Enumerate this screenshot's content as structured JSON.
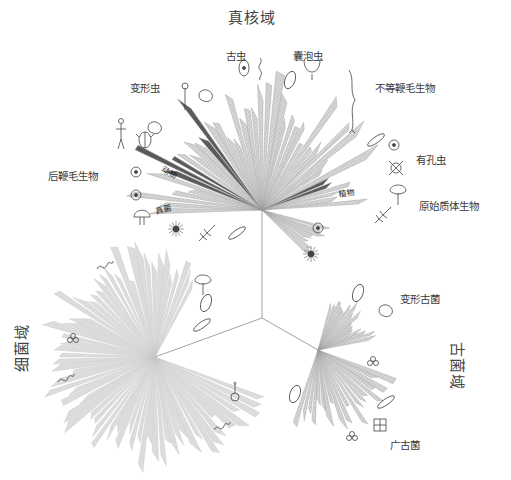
{
  "domains": {
    "eukarya": {
      "label": "真核域",
      "x": 228,
      "y": 6
    },
    "bacteria": {
      "label": "细菌域",
      "x": -2,
      "y": 336
    },
    "archaea": {
      "label": "古菌域",
      "x": 436,
      "y": 355
    }
  },
  "groups": [
    {
      "id": "archaeplastida-old",
      "label": "古虫",
      "x": 226,
      "y": 48
    },
    {
      "id": "alveolata",
      "label": "囊泡虫",
      "x": 293,
      "y": 48
    },
    {
      "id": "amoebozoa",
      "label": "变形虫",
      "x": 130,
      "y": 80
    },
    {
      "id": "stramenopiles",
      "label": "不等鞭毛生物",
      "x": 375,
      "y": 80
    },
    {
      "id": "rhizaria",
      "label": "有孔虫",
      "x": 416,
      "y": 152
    },
    {
      "id": "opisthokonta",
      "label": "后鞭毛生物",
      "x": 48,
      "y": 168
    },
    {
      "id": "archaeplastida",
      "label": "原始质体生物",
      "x": 419,
      "y": 198
    },
    {
      "id": "crenarchaeota",
      "label": "变形古菌",
      "x": 400,
      "y": 291
    },
    {
      "id": "euryarchaeota",
      "label": "广古菌",
      "x": 390,
      "y": 437
    }
  ],
  "wedge_labels": [
    {
      "label": "动物",
      "x": 161,
      "y": 171,
      "rotate": 28
    },
    {
      "label": "真菌",
      "x": 156,
      "y": 214,
      "rotate": -12
    },
    {
      "label": "植物",
      "x": 339,
      "y": 197,
      "rotate": -8
    }
  ],
  "colors": {
    "wedge_fill": "#d2d2d2",
    "wedge_stroke": "#9a9a9a",
    "wedge_dark": "#5a5a5a",
    "bacteria_fill": "#dcdcdc",
    "branch_line": "#8a8a8a",
    "text": "#3a3a3a"
  },
  "tree": {
    "root": [
      262,
      318
    ],
    "hubs": {
      "eukarya": [
        262,
        210
      ],
      "bacteria": [
        155,
        357
      ],
      "archaea": [
        318,
        350
      ]
    },
    "fans": [
      {
        "name": "eukarya-main",
        "hub": "eukarya",
        "start": 178,
        "end": 358,
        "count": 46,
        "rmin": 70,
        "rmax": 145,
        "dark": [
          {
            "index": 6,
            "span": 3
          },
          {
            "index": 13,
            "span": 2
          },
          {
            "index": 40,
            "span": 2
          }
        ]
      },
      {
        "name": "eukarya-lower",
        "hub": "eukarya",
        "start": 15,
        "end": 45,
        "count": 8,
        "rmin": 55,
        "rmax": 75,
        "dark": []
      },
      {
        "name": "bacteria-fan",
        "hub": "bacteria",
        "start": 20,
        "end": 300,
        "count": 70,
        "rmin": 80,
        "rmax": 120,
        "dark": []
      },
      {
        "name": "archaea-upper",
        "hub": "archaea",
        "start": 285,
        "end": 350,
        "count": 16,
        "rmin": 40,
        "rmax": 65,
        "dark": []
      },
      {
        "name": "archaea-lower",
        "hub": "archaea",
        "start": 20,
        "end": 110,
        "count": 20,
        "rmin": 55,
        "rmax": 90,
        "dark": []
      }
    ]
  },
  "organisms": [
    {
      "name": "euglena-icon",
      "x": 244,
      "y": 68,
      "shape": "cell"
    },
    {
      "name": "trypanosome-icon",
      "x": 260,
      "y": 68,
      "shape": "flagellate"
    },
    {
      "name": "paramecium-icon",
      "x": 290,
      "y": 80,
      "shape": "oval"
    },
    {
      "name": "ciliate-icon",
      "x": 312,
      "y": 70,
      "shape": "cup"
    },
    {
      "name": "diatom-chain-icon",
      "x": 352,
      "y": 100,
      "shape": "kelp"
    },
    {
      "name": "diatom-icon",
      "x": 376,
      "y": 140,
      "shape": "spindle"
    },
    {
      "name": "foram-icon",
      "x": 394,
      "y": 145,
      "shape": "round"
    },
    {
      "name": "radiolarian-icon",
      "x": 396,
      "y": 168,
      "shape": "cross"
    },
    {
      "name": "tree-icon",
      "x": 398,
      "y": 193,
      "shape": "tree"
    },
    {
      "name": "fern-icon",
      "x": 383,
      "y": 215,
      "shape": "leaf"
    },
    {
      "name": "amoeba-icon",
      "x": 206,
      "y": 96,
      "shape": "blob"
    },
    {
      "name": "slime-mold-icon",
      "x": 185,
      "y": 100,
      "shape": "stalk"
    },
    {
      "name": "human-icon",
      "x": 121,
      "y": 135,
      "shape": "human"
    },
    {
      "name": "beetle-icon",
      "x": 145,
      "y": 140,
      "shape": "beetle"
    },
    {
      "name": "sponge-icon",
      "x": 155,
      "y": 128,
      "shape": "blob"
    },
    {
      "name": "choanoflagellate-icon",
      "x": 136,
      "y": 172,
      "shape": "round"
    },
    {
      "name": "mushroom-icon",
      "x": 136,
      "y": 195,
      "shape": "round"
    },
    {
      "name": "yeast-icon",
      "x": 142,
      "y": 217,
      "shape": "mushroom"
    },
    {
      "name": "heliozoan-icon",
      "x": 176,
      "y": 229,
      "shape": "star"
    },
    {
      "name": "cercozoan-icon",
      "x": 207,
      "y": 233,
      "shape": "leaf"
    },
    {
      "name": "cryptomonad-icon",
      "x": 237,
      "y": 233,
      "shape": "spindle"
    },
    {
      "name": "pollen-icon",
      "x": 318,
      "y": 228,
      "shape": "round"
    },
    {
      "name": "sun-icon",
      "x": 311,
      "y": 254,
      "shape": "star"
    },
    {
      "name": "bacterium-1-icon",
      "x": 105,
      "y": 265,
      "shape": "squiggle"
    },
    {
      "name": "flower-microbe-icon",
      "x": 203,
      "y": 283,
      "shape": "tree"
    },
    {
      "name": "coccus-icon",
      "x": 206,
      "y": 303,
      "shape": "oval"
    },
    {
      "name": "bacillus-icon",
      "x": 202,
      "y": 325,
      "shape": "spindle"
    },
    {
      "name": "diplococcus-icon",
      "x": 73,
      "y": 340,
      "shape": "cocci"
    },
    {
      "name": "spirillum-icon",
      "x": 66,
      "y": 378,
      "shape": "squiggle"
    },
    {
      "name": "vibrio-icon",
      "x": 235,
      "y": 393,
      "shape": "loop"
    },
    {
      "name": "spirochete-icon",
      "x": 222,
      "y": 426,
      "shape": "squiggle"
    },
    {
      "name": "archaea-cell-1-icon",
      "x": 358,
      "y": 293,
      "shape": "oval"
    },
    {
      "name": "archaea-cell-2-icon",
      "x": 386,
      "y": 311,
      "shape": "blob"
    },
    {
      "name": "archaea-cluster-1-icon",
      "x": 373,
      "y": 363,
      "shape": "cocci"
    },
    {
      "name": "archaea-rod-icon",
      "x": 295,
      "y": 394,
      "shape": "oval"
    },
    {
      "name": "archaea-rods-icon",
      "x": 386,
      "y": 402,
      "shape": "spindle"
    },
    {
      "name": "sarcina-icon",
      "x": 380,
      "y": 425,
      "shape": "grid"
    },
    {
      "name": "archaea-cluster-2-icon",
      "x": 352,
      "y": 438,
      "shape": "cocci"
    }
  ]
}
